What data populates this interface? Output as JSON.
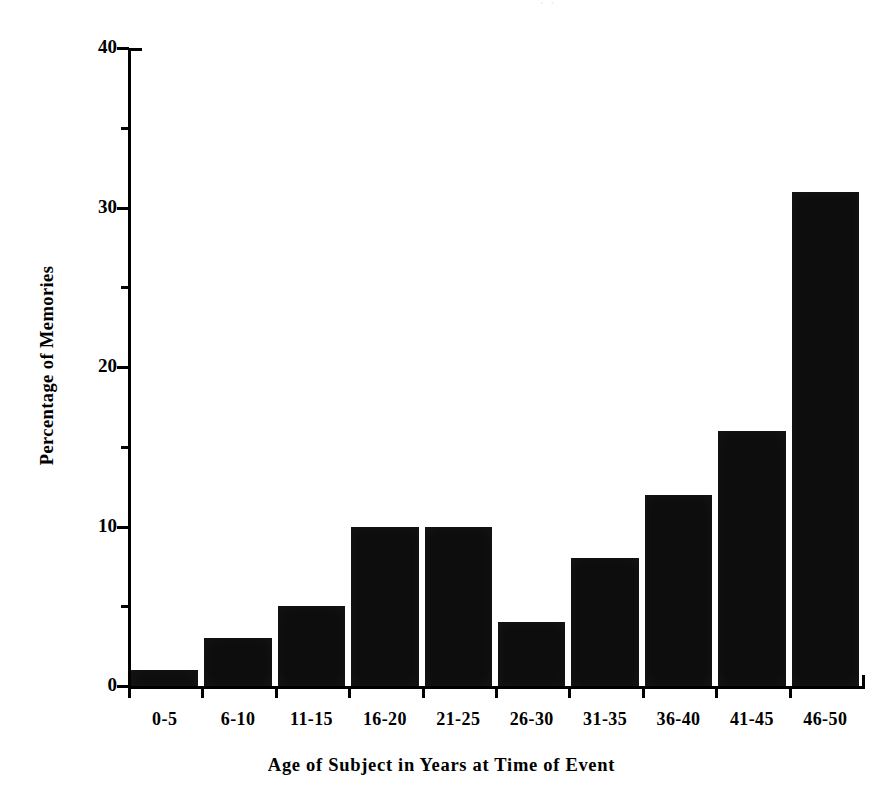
{
  "figure": {
    "top_artifact_text": "· ·",
    "background_color": "#ffffff",
    "bar_color": "#0d0d0d",
    "axis_color": "#000000"
  },
  "chart_data": {
    "type": "bar",
    "title": "",
    "xlabel": "Age of Subject in Years at Time of Event",
    "ylabel": "Percentage of Memories",
    "categories": [
      "0-5",
      "6-10",
      "11-15",
      "16-20",
      "21-25",
      "26-30",
      "31-35",
      "36-40",
      "41-45",
      "46-50"
    ],
    "values": [
      1,
      3,
      5,
      10,
      10,
      4,
      8,
      12,
      16,
      31
    ],
    "ylim": [
      0,
      40
    ],
    "y_major_ticks": [
      0,
      10,
      20,
      30,
      40
    ],
    "y_minor_ticks": [
      5,
      15,
      25,
      35
    ],
    "y_tick_labels": [
      "0",
      "10",
      "20",
      "30",
      "40"
    ],
    "grid": false,
    "legend": false,
    "legend_position": "none"
  }
}
